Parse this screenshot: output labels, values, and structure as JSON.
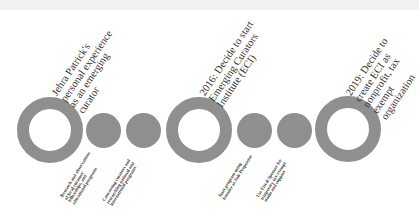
{
  "colors": {
    "shape": "#8f8f8f",
    "background": "#ffffff"
  },
  "milestones": [
    {
      "label": "Jehra Patrick's\npersonal experience\nas an emerging\ncurator"
    },
    {
      "label": "2016: Decide to start\nEmerging Curators\nInstitute (ECI)"
    },
    {
      "label": "2019: Decide to\ncreate ECI as\nnonprofit, tax exempt\norganization"
    }
  ],
  "steps": [
    {
      "label": "Research and observations\nof local curators'\nfellowships, and\neducational programs"
    },
    {
      "label": "Canvassing curators and\nresearching national and\ninternational programs"
    },
    {
      "label": "Start program using\nfounder as Sole Proprietor"
    },
    {
      "label": "Use Fiscal Sponsor for\ntemporary tax-exempt\nstatus and support"
    }
  ]
}
